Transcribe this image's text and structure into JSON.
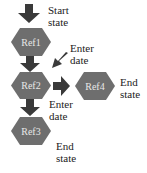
{
  "diagram": {
    "colors": {
      "node_fill": "#6e6e6e",
      "arrow": "#3a3a3a",
      "node_text": "#e6e6e6"
    },
    "nodes": [
      {
        "id": "ref1",
        "label": "Ref1"
      },
      {
        "id": "ref2",
        "label": "Ref2"
      },
      {
        "id": "ref3",
        "label": "Ref3"
      },
      {
        "id": "ref4",
        "label": "Ref4"
      }
    ],
    "annotations": {
      "start": "Start\nstate",
      "enter_date_1": "Enter\ndate",
      "enter_date_2": "Enter\ndate",
      "end_ref4": "End\nstate",
      "end_ref3": "End\nstate"
    },
    "edges": [
      {
        "from": "start",
        "to": "ref1"
      },
      {
        "from": "ref1",
        "to": "ref2",
        "label": "Enter date"
      },
      {
        "from": "ref2",
        "to": "ref4"
      },
      {
        "from": "ref2",
        "to": "ref3",
        "label": "Enter date"
      }
    ]
  }
}
